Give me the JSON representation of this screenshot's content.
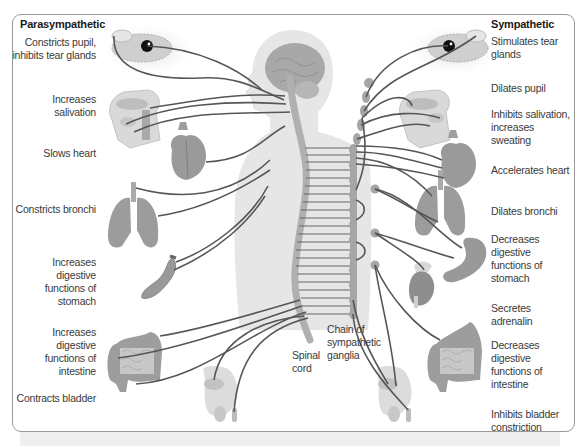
{
  "parasympathetic": {
    "header": "Parasympathetic",
    "effects": [
      {
        "organ": "eye",
        "text": "Constricts pupil, inhibits tear glands"
      },
      {
        "organ": "salivary-glands",
        "text": "Increases salivation"
      },
      {
        "organ": "heart",
        "text": "Slows heart"
      },
      {
        "organ": "lungs",
        "text": "Constricts bronchi"
      },
      {
        "organ": "stomach",
        "text": "Increases digestive functions of stomach"
      },
      {
        "organ": "intestine",
        "text": "Increases digestive functions of intestine"
      },
      {
        "organ": "bladder",
        "text": "Contracts bladder"
      }
    ]
  },
  "sympathetic": {
    "header": "Sympathetic",
    "effects": [
      {
        "organ": "tear-glands",
        "text": "Stimulates tear glands"
      },
      {
        "organ": "eye",
        "text": "Dilates pupil"
      },
      {
        "organ": "salivary-sweat-glands",
        "text": "Inhibits salivation, increases sweating"
      },
      {
        "organ": "heart",
        "text": "Accelerates heart"
      },
      {
        "organ": "lungs",
        "text": "Dilates bronchi"
      },
      {
        "organ": "stomach",
        "text": "Decreases digestive functions of stomach"
      },
      {
        "organ": "adrenal-gland",
        "text": "Secretes adrenalin"
      },
      {
        "organ": "intestine",
        "text": "Decreases digestive functions of intestine"
      },
      {
        "organ": "bladder",
        "text": "Inhibits bladder constriction"
      }
    ]
  },
  "center_labels": {
    "spinal_cord": "Spinal cord",
    "ganglia_chain": "Chain of sympathetic ganglia"
  },
  "colors": {
    "nerve": "#555555",
    "organ_fill": "#9a9a9a",
    "body_fill": "#e4e4e4",
    "frame_border": "#9a9a9a"
  }
}
